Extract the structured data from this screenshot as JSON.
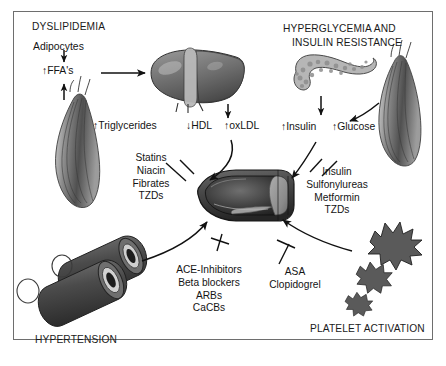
{
  "figure": {
    "title_visible": false,
    "background_color": "#ffffff",
    "border_color": "#6e6e6e"
  },
  "headings": {
    "dyslipidemia": "DYSLIPIDEMIA",
    "hyperglycemia_line1": "HYPERGLYCEMIA AND",
    "hyperglycemia_line2": "INSULIN RESISTANCE",
    "hypertension": "HYPERTENSION",
    "platelet_activation": "PLATELET ACTIVATION"
  },
  "terms": {
    "adipocytes": "Adipocytes",
    "ffa": "↑FFA's",
    "triglycerides": "↑Triglycerides",
    "hdl": "↓HDL",
    "oxldl": "↑oxLDL",
    "insulin": "↑Insulin",
    "glucose": "↑Glucose"
  },
  "drug_groups": {
    "lipid": {
      "name": "lipid-lowering-drugs",
      "items": [
        "Statins",
        "Niacin",
        "Fibrates",
        "TZDs"
      ]
    },
    "glycemic": {
      "name": "glycemic-control-drugs",
      "items": [
        "Insulin",
        "Sulfonylureas",
        "Metformin",
        "TZDs"
      ]
    },
    "antihypertensive": {
      "name": "antihypertensive-drugs",
      "items": [
        "ACE-Inhibitors",
        "Beta blockers",
        "ARBs",
        "CaCBs"
      ]
    },
    "antiplatelet": {
      "name": "antiplatelet-drugs",
      "items": [
        "ASA",
        "Clopidogrel"
      ]
    }
  },
  "organs": {
    "liver": "liver",
    "pancreas": "pancreas",
    "skeletal_muscle_left": "skeletal-muscle",
    "skeletal_muscle_right": "skeletal-muscle",
    "artery_cross_section": "atherosclerotic-artery",
    "blood_vessels": "blood-vessel-pair",
    "platelets": "activated-platelets"
  },
  "colors": {
    "organ_fill": "#7d7d7d",
    "organ_dark": "#3a3a3a",
    "line": "#111111",
    "pancreas_fill": "#b6b6b6",
    "plaque": "#9b9b9b"
  }
}
